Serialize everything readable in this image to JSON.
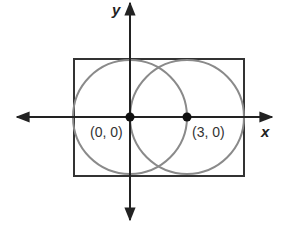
{
  "diagram": {
    "type": "coordinate-geometry",
    "axes": {
      "x_label": "x",
      "y_label": "y"
    },
    "points": [
      {
        "label": "(0, 0)",
        "x": 0,
        "y": 0
      },
      {
        "label": "(3, 0)",
        "x": 3,
        "y": 0
      }
    ],
    "circles": [
      {
        "center": [
          0,
          0
        ],
        "radius": 3
      },
      {
        "center": [
          3,
          0
        ],
        "radius": 3
      }
    ],
    "rectangle": {
      "x_min": -3,
      "x_max": 6,
      "y_min": -3,
      "y_max": 3
    },
    "colors": {
      "axis": "#222222",
      "circle": "#8a8a8a",
      "rectangle": "#333333"
    }
  }
}
